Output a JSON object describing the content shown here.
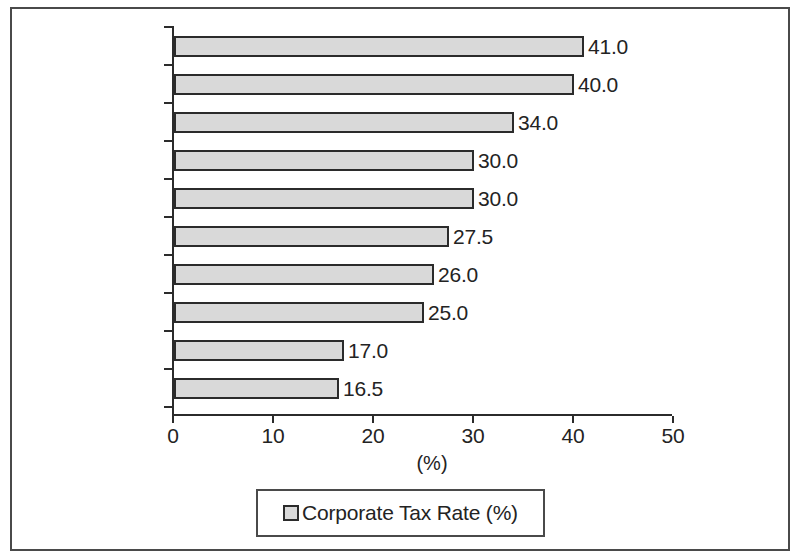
{
  "chart_data": {
    "type": "bar",
    "orientation": "horizontal",
    "title": "",
    "xlabel": "(%)",
    "ylabel": "",
    "xlim": [
      0,
      50
    ],
    "xticks": [
      0,
      10,
      20,
      30,
      40,
      50
    ],
    "grid": false,
    "legend_position": "bottom",
    "categories": [
      "Japan",
      "US",
      "India",
      "Indonesia",
      "Australia",
      "South Korea",
      "Malaysia",
      "China",
      "Singapore",
      "Hong Kong"
    ],
    "values": [
      41.0,
      40.0,
      34.0,
      30.0,
      30.0,
      27.5,
      26.0,
      25.0,
      17.0,
      16.5
    ],
    "value_labels": [
      "41.0",
      "40.0",
      "34.0",
      "30.0",
      "30.0",
      "27.5",
      "26.0",
      "25.0",
      "17.0",
      "16.5"
    ],
    "series": [
      {
        "name": "Corporate Tax Rate (%)",
        "values": [
          41.0,
          40.0,
          34.0,
          30.0,
          30.0,
          27.5,
          26.0,
          25.0,
          17.0,
          16.5
        ]
      }
    ]
  },
  "legend": {
    "label": "Corporate Tax Rate (%)"
  },
  "colors": {
    "bar_fill": "#d9d9d9",
    "bar_border": "#2b2b2b",
    "axis": "#2b2b2b",
    "text": "#232323",
    "frame": "#4a4a4a",
    "background": "#ffffff"
  }
}
